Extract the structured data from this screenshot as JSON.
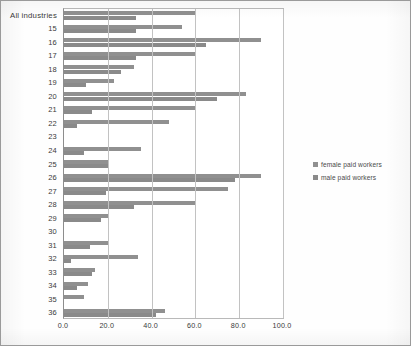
{
  "chart_data": {
    "type": "bar",
    "orientation": "horizontal",
    "title": "",
    "xlabel": "",
    "ylabel": "",
    "xlim": [
      0.0,
      100.0
    ],
    "xticks": [
      "0.0",
      "20.0",
      "40.0",
      "60.0",
      "80.0",
      "100.0"
    ],
    "xtick_values": [
      0,
      20,
      40,
      60,
      80,
      100
    ],
    "grid": true,
    "legend_position": "right",
    "categories": [
      "All industries",
      "15",
      "16",
      "17",
      "18",
      "19",
      "20",
      "21",
      "22",
      "23",
      "24",
      "25",
      "26",
      "27",
      "28",
      "29",
      "30",
      "31",
      "32",
      "33",
      "34",
      "35",
      "36"
    ],
    "series": [
      {
        "name": "female paid workers",
        "color": "#909090",
        "values": [
          60.0,
          54.0,
          90.0,
          60.0,
          32.0,
          23.0,
          83.0,
          60.0,
          48.0,
          0.0,
          35.0,
          20.0,
          90.0,
          75.0,
          60.0,
          20.0,
          0.0,
          20.0,
          34.0,
          14.0,
          11.0,
          9.0,
          46.0
        ]
      },
      {
        "name": "male paid workers",
        "color": "#8a8a8a",
        "values": [
          33.0,
          33.0,
          65.0,
          33.0,
          26.0,
          10.0,
          70.0,
          13.0,
          6.0,
          0.0,
          9.0,
          20.0,
          78.0,
          19.0,
          32.0,
          17.0,
          0.0,
          12.0,
          3.0,
          13.0,
          6.0,
          0.0,
          42.0
        ]
      }
    ]
  },
  "legend": {
    "items": [
      {
        "label": "female paid workers"
      },
      {
        "label": "male paid workers"
      }
    ]
  }
}
